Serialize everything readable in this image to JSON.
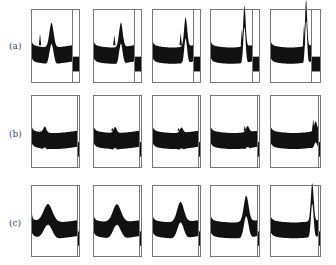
{
  "figure": {
    "rows": [
      {
        "label": "(a)",
        "label_pos": [
          9,
          41
        ],
        "top": 9,
        "bottom": 83,
        "panels": [
          {
            "left": 31,
            "right": 80,
            "divider": 72,
            "spike": 0.22,
            "spike_h": 0.62,
            "peak": 0.5,
            "peak_h": 0.3,
            "peak_w": 0.07
          },
          {
            "left": 93,
            "right": 142,
            "divider": 134,
            "spike": 0.52,
            "spike_h": 0.6,
            "peak": 0.68,
            "peak_h": 0.3,
            "peak_w": 0.06
          },
          {
            "left": 152,
            "right": 201,
            "divider": 193,
            "spike": 0.7,
            "spike_h": 0.63,
            "peak": 0.82,
            "peak_h": 0.36,
            "peak_w": 0.05
          },
          {
            "left": 210,
            "right": 260,
            "divider": 252,
            "spike": 0.76,
            "spike_h": 0.68,
            "peak": 0.82,
            "peak_h": 0.52,
            "peak_w": 0.04
          },
          {
            "left": 270,
            "right": 321,
            "divider": 311,
            "spike": 0.83,
            "spike_h": 0.74,
            "peak": 0.88,
            "peak_h": 0.6,
            "peak_w": 0.035
          }
        ]
      },
      {
        "label": "(b)",
        "label_pos": [
          9,
          129
        ],
        "top": 95,
        "bottom": 168,
        "panels": [
          {
            "left": 31,
            "right": 80,
            "divider": 77,
            "spike": 0.2,
            "spike_h": 0.45,
            "peak": 0.3,
            "peak_h": 0.05,
            "peak_w": 0.04
          },
          {
            "left": 93,
            "right": 142,
            "divider": 139,
            "spike": 0.42,
            "spike_h": 0.5,
            "peak": 0.48,
            "peak_h": 0.05,
            "peak_w": 0.04
          },
          {
            "left": 152,
            "right": 201,
            "divider": 198,
            "spike": 0.58,
            "spike_h": 0.5,
            "peak": 0.64,
            "peak_h": 0.04,
            "peak_w": 0.04
          },
          {
            "left": 210,
            "right": 260,
            "divider": 257,
            "spike": 0.74,
            "spike_h": 0.53,
            "peak": 0.8,
            "peak_h": 0.05,
            "peak_w": 0.04
          },
          {
            "left": 270,
            "right": 321,
            "divider": 318,
            "spike": 0.9,
            "spike_h": 0.62,
            "peak": 0.95,
            "peak_h": 0.1,
            "peak_w": 0.04
          }
        ]
      },
      {
        "label": "(c)",
        "label_pos": [
          9,
          218
        ],
        "top": 185,
        "bottom": 257,
        "panels": [
          {
            "left": 31,
            "right": 80,
            "divider": 77,
            "spike": 0.02,
            "spike_h": 0.55,
            "peak": 0.37,
            "peak_h": 0.22,
            "peak_w": 0.13
          },
          {
            "left": 93,
            "right": 142,
            "divider": 139,
            "spike": 0.02,
            "spike_h": 0.5,
            "peak": 0.52,
            "peak_h": 0.22,
            "peak_w": 0.12
          },
          {
            "left": 152,
            "right": 201,
            "divider": 198,
            "spike": 0.02,
            "spike_h": 0.45,
            "peak": 0.62,
            "peak_h": 0.25,
            "peak_w": 0.1
          },
          {
            "left": 210,
            "right": 260,
            "divider": 257,
            "spike": 0.02,
            "spike_h": 0.4,
            "peak": 0.77,
            "peak_h": 0.33,
            "peak_w": 0.07
          },
          {
            "left": 270,
            "right": 321,
            "divider": 318,
            "spike": 0.02,
            "spike_h": 0.35,
            "peak": 0.88,
            "peak_h": 0.5,
            "peak_w": 0.04
          }
        ]
      }
    ],
    "colors": {
      "ink": "#111111",
      "frame": "#777777"
    }
  }
}
